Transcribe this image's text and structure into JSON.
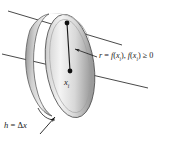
{
  "figure": {
    "background_color": "#ffffff",
    "stroke_color": "#1a1a1a",
    "disk_face_light": "#f2f2f2",
    "disk_face_dark": "#8c8c8c",
    "disk_edge_color": "#b3b3b3"
  },
  "labels": {
    "radius": {
      "r": "r",
      "equals": " = ",
      "f1": "f",
      "open1": "(",
      "x1": "x",
      "sub1": "i",
      "close1": ")",
      "comma": ", ",
      "f2": "f",
      "open2": "(",
      "x2": "x",
      "sub2": "i",
      "close2": ")",
      "ge": " ≥ 0",
      "full_text": "r = f(xi), f(xi) ≥ 0"
    },
    "center": {
      "x": "x",
      "sub": "i",
      "full_text": "xi"
    },
    "thickness": {
      "h": "h",
      "equals": " = ",
      "delta": "Δ",
      "x": "x",
      "full_text": "h = Δx"
    }
  },
  "geometry": {
    "axis_lines": 2,
    "radius_arrow": "arrow pointing left toward radius segment",
    "thickness_arrow": "arrow pointing up-right toward disk edge"
  }
}
